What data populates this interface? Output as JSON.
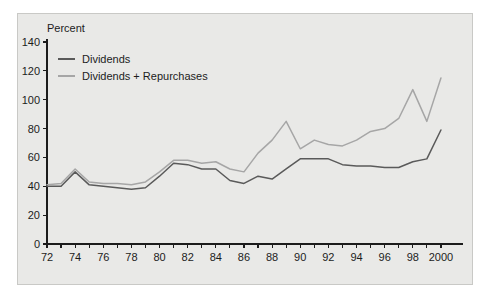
{
  "figure": {
    "background_color": "#e9e9e7",
    "page_color": "#ffffff",
    "axis_color": "#1c1c1c",
    "unit_label": "Percent"
  },
  "legend": {
    "position": "top-left-inside",
    "entries": [
      {
        "label": "Dividends",
        "color": "#5a5a5a"
      },
      {
        "label": "Dividends + Repurchases",
        "color": "#a6a6a6"
      }
    ]
  },
  "chart_data": {
    "type": "line",
    "title": "",
    "subtitle": "",
    "xlabel": "",
    "ylabel": "Percent",
    "ylim": [
      0,
      140
    ],
    "xlim": [
      1972,
      2001
    ],
    "grid": false,
    "legend_position": "top-left-inside",
    "ytick_labels": [
      "0",
      "20",
      "40",
      "60",
      "80",
      "100",
      "120",
      "140"
    ],
    "ytick_values": [
      0,
      20,
      40,
      60,
      80,
      100,
      120,
      140
    ],
    "xtick_values": [
      1972,
      1973,
      1974,
      1975,
      1976,
      1977,
      1978,
      1979,
      1980,
      1981,
      1982,
      1983,
      1984,
      1985,
      1986,
      1987,
      1988,
      1989,
      1990,
      1991,
      1992,
      1993,
      1994,
      1995,
      1996,
      1997,
      1998,
      1999,
      2000
    ],
    "xtick_labels": [
      "72",
      "",
      "74",
      "",
      "76",
      "",
      "78",
      "",
      "80",
      "",
      "82",
      "",
      "84",
      "",
      "86",
      "",
      "88",
      "",
      "90",
      "",
      "92",
      "",
      "94",
      "",
      "96",
      "",
      "98",
      "",
      "2000"
    ],
    "x": [
      1972,
      1973,
      1974,
      1975,
      1976,
      1977,
      1978,
      1979,
      1980,
      1981,
      1982,
      1983,
      1984,
      1985,
      1986,
      1987,
      1988,
      1989,
      1990,
      1991,
      1992,
      1993,
      1994,
      1995,
      1996,
      1997,
      1998,
      1999,
      2000
    ],
    "series": [
      {
        "name": "Dividends",
        "color": "#5a5a5a",
        "values": [
          40,
          40,
          50,
          41,
          40,
          39,
          38,
          39,
          47,
          56,
          55,
          52,
          52,
          44,
          42,
          47,
          45,
          52,
          59,
          59,
          59,
          55,
          54,
          54,
          53,
          53,
          57,
          59,
          79
        ]
      },
      {
        "name": "Dividends + Repurchases",
        "color": "#a6a6a6",
        "values": [
          41,
          42,
          52,
          43,
          42,
          42,
          41,
          43,
          50,
          58,
          58,
          56,
          57,
          52,
          50,
          63,
          72,
          85,
          66,
          72,
          69,
          68,
          72,
          78,
          80,
          87,
          107,
          85,
          115
        ]
      }
    ]
  }
}
